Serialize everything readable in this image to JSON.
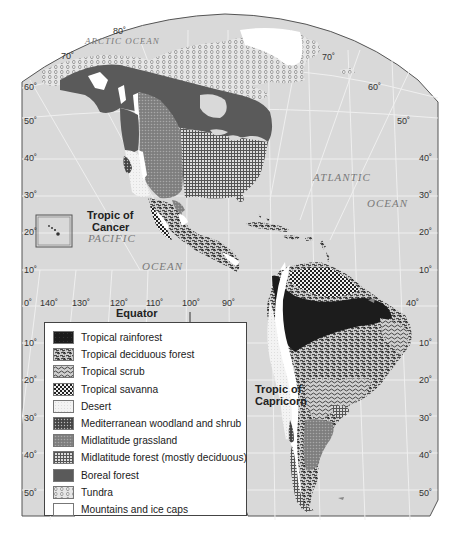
{
  "map": {
    "title": "Biomes of the Americas",
    "ocean_labels": {
      "arctic": "ARCTIC OCEAN",
      "atlantic_1": "ATLANTIC",
      "atlantic_2": "OCEAN",
      "pacific_1": "PACIFIC",
      "pacific_2": "OCEAN"
    },
    "line_labels": {
      "tropic_cancer_1": "Tropic of",
      "tropic_cancer_2": "Cancer",
      "tropic_capricorn_1": "Tropic of",
      "tropic_capricorn_2": "Capricorn",
      "equator": "Equator"
    },
    "longitude_labels": [
      "140˚",
      "130˚",
      "120˚",
      "110˚",
      "100˚",
      "90˚",
      "40˚"
    ],
    "longitude_top_labels": [
      "80˚",
      "70˚",
      "70˚"
    ],
    "latitude_labels_left": [
      "60˚",
      "50˚",
      "40˚",
      "30˚",
      "20˚",
      "10˚",
      "0˚",
      "10˚",
      "20˚",
      "30˚",
      "40˚",
      "50˚"
    ],
    "latitude_labels_right": [
      "60˚",
      "50˚",
      "40˚",
      "30˚",
      "20˚",
      "10˚",
      "10˚",
      "20˚",
      "30˚",
      "40˚",
      "50˚"
    ]
  },
  "legend": {
    "items": [
      {
        "label": "Tropical rainforest",
        "pattern": "rainforest"
      },
      {
        "label": "Tropical deciduous forest",
        "pattern": "trop-deciduous"
      },
      {
        "label": "Tropical scrub",
        "pattern": "trop-scrub"
      },
      {
        "label": "Tropical savanna",
        "pattern": "savanna"
      },
      {
        "label": "Desert",
        "pattern": "desert"
      },
      {
        "label": "Mediterranean woodland and shrub",
        "pattern": "mediterranean"
      },
      {
        "label": "Midlatitude grassland",
        "pattern": "grassland"
      },
      {
        "label": "Midlatitude forest (mostly deciduous)",
        "pattern": "mid-forest"
      },
      {
        "label": "Boreal forest",
        "pattern": "boreal"
      },
      {
        "label": "Tundra",
        "pattern": "tundra"
      },
      {
        "label": "Mountains and ice caps",
        "pattern": "mountains"
      }
    ]
  },
  "colors": {
    "ocean": "#d9d9d9",
    "grid": "#f2f2f2",
    "frame": "#555555",
    "rainforest": "#1c1c1c",
    "boreal": "#5a5a5a",
    "mountains": "#ffffff",
    "desert": "#ececec"
  }
}
